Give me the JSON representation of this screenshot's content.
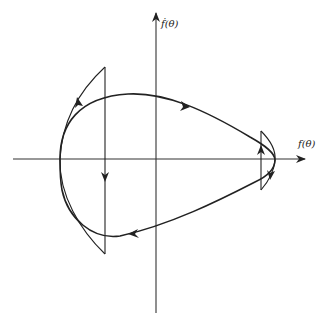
{
  "figure": {
    "type": "phase-portrait",
    "axes": {
      "x_label": "f(θ)",
      "y_label": "ḟ(θ)"
    },
    "colors": {
      "stroke": "#222222",
      "background": "#ffffff"
    },
    "elements": {
      "closed_orbit": "clockwise trajectory loop",
      "left_wedge": "left switching region with upward arrow on outer arc and downward arrow on vertical line",
      "right_wedge": "right switching region with upward arrow on vertical line and downward arrow on outer arc"
    }
  }
}
